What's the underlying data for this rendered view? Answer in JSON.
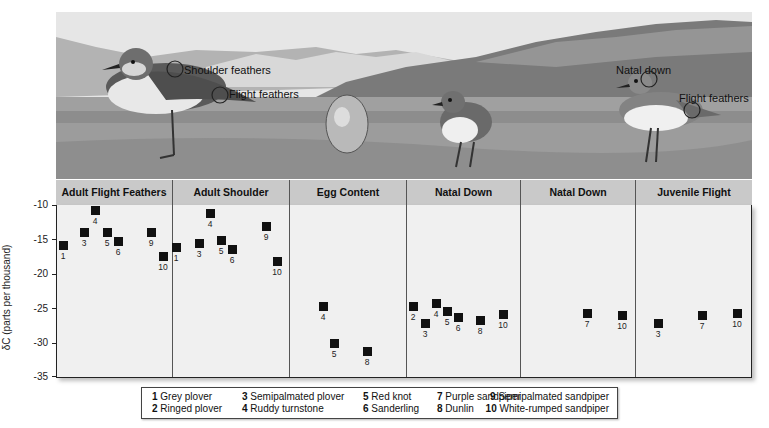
{
  "illustration": {
    "annotations": [
      {
        "text": "Shoulder feathers",
        "x": 172,
        "y": 60
      },
      {
        "text": "Flight feathers",
        "x": 229,
        "y": 83
      },
      {
        "text": "Natal down",
        "x": 616,
        "y": 59
      },
      {
        "text": "Flight feathers",
        "x": 678,
        "y": 88
      }
    ]
  },
  "chart_data": {
    "type": "scatter",
    "title": "",
    "xlabel": "",
    "ylabel": "δC (parts per thousand)",
    "ylim": [
      -35,
      -10
    ],
    "yticks": [
      -10,
      -15,
      -20,
      -25,
      -30,
      -35
    ],
    "grid": false,
    "panels": [
      {
        "name": "Adult Flight Feathers",
        "points": [
          {
            "species": 1,
            "value": -15.8
          },
          {
            "species": 3,
            "value": -13.9
          },
          {
            "species": 4,
            "value": -10.7
          },
          {
            "species": 5,
            "value": -13.9
          },
          {
            "species": 6,
            "value": -15.2
          },
          {
            "species": 9,
            "value": -13.9
          },
          {
            "species": 10,
            "value": -17.4
          }
        ]
      },
      {
        "name": "Adult Shoulder Feathers",
        "points": [
          {
            "species": 1,
            "value": -16.2
          },
          {
            "species": 3,
            "value": -15.6
          },
          {
            "species": 4,
            "value": -11.1
          },
          {
            "species": 5,
            "value": -15.1
          },
          {
            "species": 6,
            "value": -16.4
          },
          {
            "species": 9,
            "value": -13.0
          },
          {
            "species": 10,
            "value": -18.2
          }
        ]
      },
      {
        "name": "Egg Content",
        "points": [
          {
            "species": 4,
            "value": -24.8
          },
          {
            "species": 5,
            "value": -30.2
          },
          {
            "species": 8,
            "value": -31.4
          }
        ]
      },
      {
        "name": "Natal Down (Hatchlings)",
        "points": [
          {
            "species": 2,
            "value": -24.7
          },
          {
            "species": 3,
            "value": -27.3
          },
          {
            "species": 4,
            "value": -24.4
          },
          {
            "species": 5,
            "value": -25.5
          },
          {
            "species": 6,
            "value": -26.4
          },
          {
            "species": 8,
            "value": -26.8
          },
          {
            "species": 10,
            "value": -26.0
          }
        ]
      },
      {
        "name": "Natal Down (Juveniles)",
        "points": [
          {
            "species": 7,
            "value": -25.8
          },
          {
            "species": 10,
            "value": -26.1
          }
        ]
      },
      {
        "name": "Juvenile Flight Feathers",
        "points": [
          {
            "species": 3,
            "value": -27.3
          },
          {
            "species": 7,
            "value": -26.1
          },
          {
            "species": 10,
            "value": -25.8
          }
        ]
      }
    ],
    "legend": [
      {
        "num": "1",
        "name": "Grey plover"
      },
      {
        "num": "2",
        "name": "Ringed plover"
      },
      {
        "num": "3",
        "name": "Semipalmated plover"
      },
      {
        "num": "4",
        "name": "Ruddy turnstone"
      },
      {
        "num": "5",
        "name": "Red knot"
      },
      {
        "num": "6",
        "name": "Sanderling"
      },
      {
        "num": "7",
        "name": "Purple sandpiper"
      },
      {
        "num": "8",
        "name": "Dunlin"
      },
      {
        "num": "9",
        "name": "Semipalmated sandpiper"
      },
      {
        "num": "10",
        "name": "White-rumped sandpiper"
      }
    ],
    "legend_position": "bottom"
  },
  "panel_headers": [
    "Adult Flight Feathers",
    "Adult Shoulder Feathers",
    "Egg Content",
    "Natal Down (Hatchlings)",
    "Natal Down (Juveniles)",
    "Juvenile Flight Feathers"
  ],
  "y_tick_labels": [
    "-10",
    "-15",
    "-20",
    "-25",
    "-30",
    "-35"
  ],
  "colors": {
    "header_bg": "#c9c9c9",
    "plot_bg": "#f0f0f0",
    "marker": "#111111"
  }
}
